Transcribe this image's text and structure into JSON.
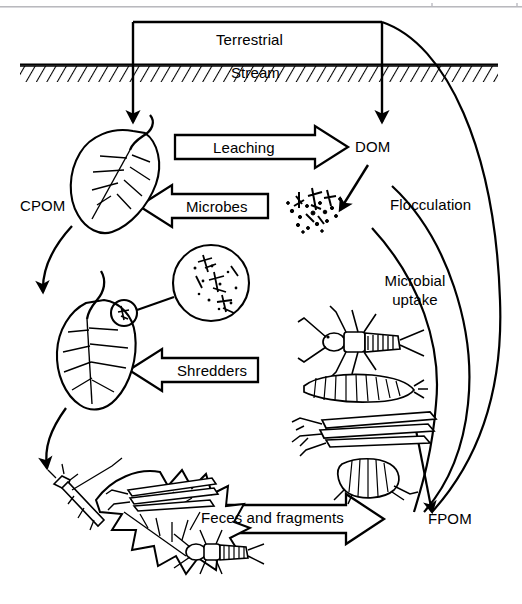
{
  "figure": {
    "zones": {
      "terrestrial": "Terrestrial",
      "stream": "Stream"
    },
    "pools": [
      {
        "id": "cpom",
        "label": "CPOM",
        "full_name": "coarse particulate organic matter"
      },
      {
        "id": "dom",
        "label": "DOM",
        "full_name": "dissolved organic matter"
      },
      {
        "id": "fpom",
        "label": "FPOM",
        "full_name": "fine particulate organic matter"
      }
    ],
    "process_arrows": [
      {
        "id": "leaching",
        "label": "Leaching",
        "direction": "right"
      },
      {
        "id": "microbes",
        "label": "Microbes",
        "direction": "left"
      },
      {
        "id": "shredders",
        "label": "Shredders",
        "direction": "left"
      },
      {
        "id": "feces-and-fragments",
        "label": "Feces and fragments",
        "direction": "right"
      }
    ],
    "curve_labels": [
      {
        "id": "flocculation",
        "label": "Flocculation"
      },
      {
        "id": "microbial-uptake",
        "line1": "Microbial",
        "line2": "uptake"
      }
    ],
    "organisms": [
      {
        "id": "stonefly-nymph",
        "name": "stonefly nymph"
      },
      {
        "id": "cranefly-larva",
        "name": "cranefly larva"
      },
      {
        "id": "caddisfly-stick-case",
        "name": "caddisfly larva in stick case"
      },
      {
        "id": "amphipod",
        "name": "amphipod"
      }
    ],
    "colors": {
      "ink": "#000000",
      "paper": "#ffffff",
      "scan_rule": "#b9b9bd"
    }
  }
}
